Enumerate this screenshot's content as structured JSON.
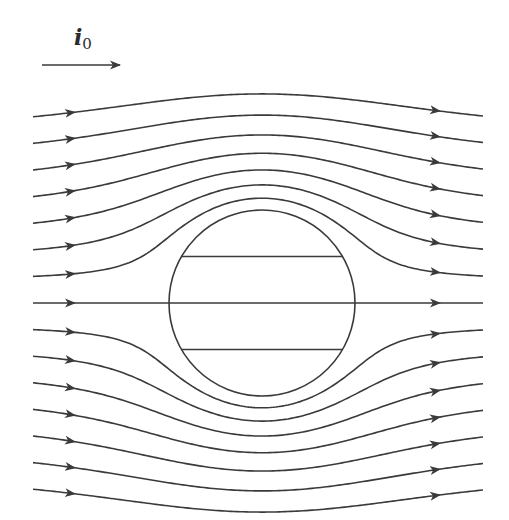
{
  "figure": {
    "reference_vector": {
      "symbol": "i",
      "subscript": "0",
      "meaning": "direction of free-stream flow"
    },
    "flow": {
      "model": "potential flow past cylinder",
      "direction": "left-to-right",
      "streamline_count": 15,
      "streamline_offsets_in_radii": [
        -2.0,
        -1.72,
        -1.43,
        -1.14,
        -0.86,
        -0.57,
        -0.29,
        0.0,
        0.29,
        0.57,
        0.86,
        1.14,
        1.43,
        1.72,
        2.0
      ],
      "interior_chords_in_radii": [
        -0.5,
        0.0,
        0.5
      ]
    },
    "colors": {
      "line": "#3a3a3a",
      "background": "#ffffff"
    }
  }
}
